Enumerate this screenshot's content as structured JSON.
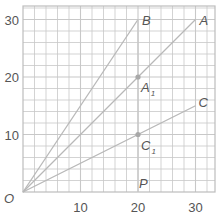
{
  "chart_data": {
    "type": "line",
    "title": "",
    "xlabel": "",
    "ylabel": "",
    "xlim": [
      0,
      33.5
    ],
    "ylim": [
      0,
      32.5
    ],
    "grid": true,
    "grid_step": 2,
    "x_ticks": [
      10,
      20,
      30
    ],
    "y_ticks": [
      10,
      20,
      30
    ],
    "origin_label": "O",
    "colors": {
      "grid": "#c8c8c8",
      "frame": "#bdbdbd",
      "line": "#b8b8b8",
      "point": "#a8a8a8",
      "text": "#555555"
    },
    "series": [
      {
        "name": "B",
        "points": [
          [
            0,
            0
          ],
          [
            20,
            30
          ]
        ]
      },
      {
        "name": "A",
        "points": [
          [
            0,
            0
          ],
          [
            30,
            30
          ]
        ]
      },
      {
        "name": "C",
        "points": [
          [
            0,
            0
          ],
          [
            30,
            15
          ]
        ]
      }
    ],
    "vertical_line": {
      "x": 20,
      "from": 0,
      "to": 30
    },
    "labeled_points": [
      {
        "name": "B",
        "sub": "",
        "x": 20,
        "y": 30,
        "dot": false
      },
      {
        "name": "A",
        "sub": "",
        "x": 30,
        "y": 30,
        "dot": false
      },
      {
        "name": "A",
        "sub": "1",
        "x": 20,
        "y": 20,
        "dot": true
      },
      {
        "name": "C",
        "sub": "",
        "x": 30,
        "y": 15,
        "dot": false
      },
      {
        "name": "C",
        "sub": "1",
        "x": 20,
        "y": 10,
        "dot": true
      },
      {
        "name": "P",
        "sub": "",
        "x": 20,
        "y": 0,
        "dot": false
      }
    ]
  }
}
